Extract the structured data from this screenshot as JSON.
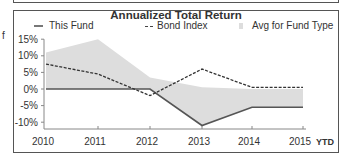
{
  "left_fragment": "f",
  "chart_data": {
    "type": "line",
    "title": "Annualized Total Return",
    "xlabel": "",
    "ylabel": "",
    "categories": [
      "2010",
      "2011",
      "2012",
      "2013",
      "2014",
      "2015"
    ],
    "x_suffix_label": "YTD",
    "ylim": [
      -12,
      16
    ],
    "yticks": [
      "15%",
      "10%",
      "5%",
      "0%",
      "-5%",
      "-10%"
    ],
    "ytick_values": [
      15,
      10,
      5,
      0,
      -5,
      -10
    ],
    "grid": false,
    "legend_position": "top",
    "series": [
      {
        "name": "This Fund",
        "style": "solid",
        "color": "#555555",
        "values": [
          0,
          0,
          0,
          -11,
          -5.5,
          -5.5
        ]
      },
      {
        "name": "Bond Index",
        "style": "dashed",
        "color": "#333333",
        "values": [
          7.5,
          4.5,
          -2,
          6,
          0.5,
          0.5
        ]
      },
      {
        "name": "Avg for Fund Type",
        "style": "area",
        "color": "#dddddd",
        "values": [
          11,
          15,
          3.5,
          0.5,
          0,
          0
        ]
      }
    ]
  },
  "legend": {
    "this_fund": "This Fund",
    "bond_index": "Bond Index",
    "avg_fund_type": "Avg for Fund Type"
  }
}
